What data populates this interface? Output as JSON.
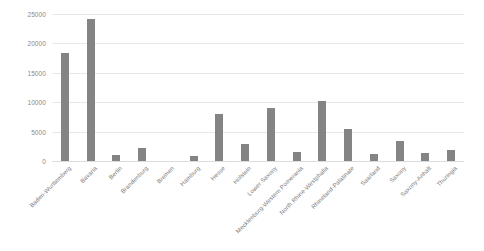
{
  "chart_data": {
    "type": "bar",
    "title": "",
    "subtitle": "",
    "xlabel": "",
    "ylabel": "",
    "ylim": [
      0,
      25000
    ],
    "yticks": [
      0,
      5000,
      10000,
      15000,
      20000,
      25000
    ],
    "ytick_labels": [
      "0",
      "5000",
      "10000",
      "15000",
      "20000",
      "25000"
    ],
    "grid": true,
    "legend": false,
    "legend_position": "none",
    "bar_color": "#848484",
    "gridline_color": "#e8e8e8",
    "tick_label_color": "#8a8a8a",
    "categories": [
      "Baden-Wurttemberg",
      "Bavaria",
      "Berlin",
      "Brandenburg",
      "Bremen",
      "Hamburg",
      "Hesse",
      "Holstein",
      "Lower Saxony",
      "Mecklenburg-Western Pomerania",
      "North Rhine-Westphalia",
      "Rhineland-Palatinate",
      "Saarland",
      "Saxony",
      "Saxony-Anhalt",
      "Thuringia"
    ],
    "values": [
      18400,
      24200,
      1000,
      2200,
      0,
      900,
      8000,
      2900,
      9000,
      1600,
      10200,
      5400,
      1200,
      3400,
      1400,
      1900
    ]
  }
}
